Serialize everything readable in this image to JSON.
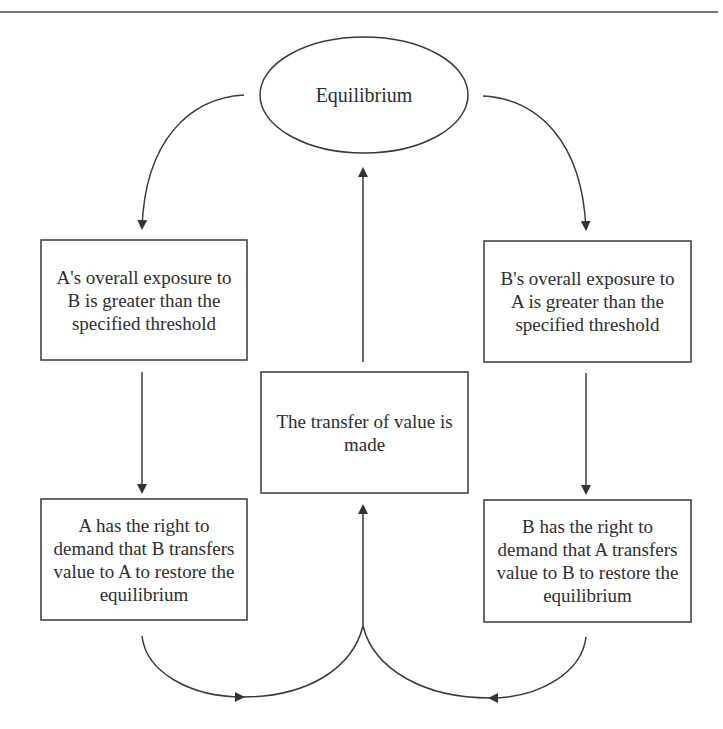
{
  "diagram": {
    "type": "flowchart",
    "nodes": {
      "equilibrium": {
        "shape": "ellipse",
        "label": "Equilibrium"
      },
      "a_exposure": {
        "shape": "rectangle",
        "label": "A's overall exposure to B is greater than the specified threshold"
      },
      "b_exposure": {
        "shape": "rectangle",
        "label": "B's overall exposure to A is greater than the specified threshold"
      },
      "transfer": {
        "shape": "rectangle",
        "label": "The transfer of value is made"
      },
      "a_right": {
        "shape": "rectangle",
        "label": "A has the right to demand that B transfers value to A to restore the equilibrium"
      },
      "b_right": {
        "shape": "rectangle",
        "label": "B has the right to demand that A transfers value to B to restore the equilibrium"
      }
    },
    "edges": [
      {
        "from": "equilibrium",
        "to": "a_exposure",
        "style": "curved-arrow"
      },
      {
        "from": "equilibrium",
        "to": "b_exposure",
        "style": "curved-arrow"
      },
      {
        "from": "a_exposure",
        "to": "a_right",
        "style": "straight-arrow"
      },
      {
        "from": "b_exposure",
        "to": "b_right",
        "style": "straight-arrow"
      },
      {
        "from": "a_right",
        "to": "transfer",
        "style": "curved-arrow"
      },
      {
        "from": "b_right",
        "to": "transfer",
        "style": "curved-arrow"
      },
      {
        "from": "transfer",
        "to": "equilibrium",
        "style": "straight-arrow"
      }
    ],
    "colors": {
      "stroke": "#3a3a3a",
      "text": "#2e2e2e",
      "background": "#ffffff"
    }
  }
}
